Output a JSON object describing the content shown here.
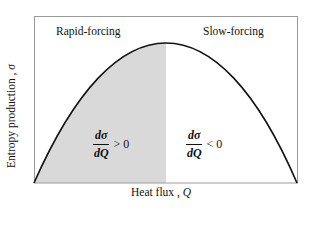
{
  "figure": {
    "regions": {
      "left": {
        "label": "Rapid-forcing",
        "derivative_numerator": "dσ",
        "derivative_denominator": "dQ",
        "relation": "> 0"
      },
      "right": {
        "label": "Slow-forcing",
        "derivative_numerator": "dσ",
        "derivative_denominator": "dQ",
        "relation": "< 0"
      }
    },
    "axes": {
      "x_label": "Heat flux ,",
      "x_symbol": "Q",
      "y_label": "Entropy  production ,",
      "y_symbol": "σ"
    },
    "colors": {
      "shade": "#d9d9d9",
      "curve": "#111111",
      "frame": "#9a9a9a"
    }
  }
}
